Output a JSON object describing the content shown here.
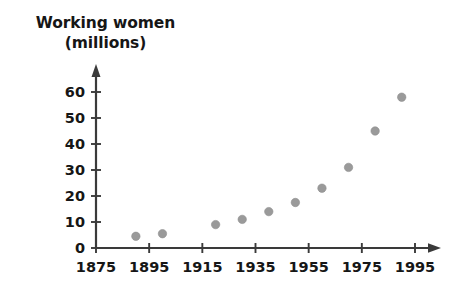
{
  "chart_data": {
    "type": "scatter",
    "title": "Working women\n(millions)",
    "title_lines": [
      "Working women",
      "(millions)"
    ],
    "xlabel": "",
    "ylabel": "Working women (millions)",
    "xlim": [
      1875,
      1995
    ],
    "ylim": [
      0,
      65
    ],
    "xticks": [
      1875,
      1895,
      1915,
      1935,
      1955,
      1975,
      1995
    ],
    "xtick_labels": [
      "1875",
      "1895",
      "1915",
      "1935",
      "1955",
      "1975",
      "1995"
    ],
    "yticks": [
      0,
      10,
      20,
      30,
      40,
      50,
      60
    ],
    "ytick_labels": [
      "0",
      "10",
      "20",
      "30",
      "40",
      "50",
      "60"
    ],
    "grid": false,
    "legend": false,
    "legend_position": "none",
    "marker_color": "#9a9a9a",
    "axis_color": "#3a3a3a",
    "x": [
      1890,
      1900,
      1920,
      1930,
      1940,
      1950,
      1960,
      1970,
      1980,
      1990
    ],
    "y": [
      4.5,
      5.5,
      9,
      11,
      14,
      17.5,
      23,
      31,
      45,
      58
    ],
    "points": [
      {
        "x": 1890,
        "y": 4.5
      },
      {
        "x": 1900,
        "y": 5.5
      },
      {
        "x": 1920,
        "y": 9
      },
      {
        "x": 1930,
        "y": 11
      },
      {
        "x": 1940,
        "y": 14
      },
      {
        "x": 1950,
        "y": 17.5
      },
      {
        "x": 1960,
        "y": 23
      },
      {
        "x": 1970,
        "y": 31
      },
      {
        "x": 1980,
        "y": 45
      },
      {
        "x": 1990,
        "y": 58
      }
    ]
  }
}
